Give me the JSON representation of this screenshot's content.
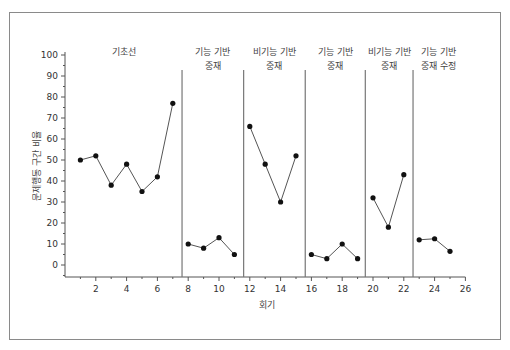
{
  "chart_data": {
    "type": "line",
    "title": "",
    "xlabel": "회기",
    "ylabel": "문제행동 구간 비율",
    "xlim": [
      0,
      26
    ],
    "ylim": [
      -5,
      100
    ],
    "x_ticks": [
      2,
      4,
      6,
      8,
      10,
      12,
      14,
      16,
      18,
      20,
      22,
      24,
      26
    ],
    "y_ticks": [
      0,
      10,
      20,
      30,
      40,
      50,
      60,
      70,
      80,
      90,
      100
    ],
    "grid": false,
    "legend": null,
    "phase_change_lines": [
      7.6,
      11.6,
      15.6,
      19.5,
      22.6
    ],
    "series": [
      {
        "name": "기초선",
        "label_lines": [
          "기초선"
        ],
        "x": [
          1,
          2,
          3,
          4,
          5,
          6,
          7
        ],
        "values": [
          50,
          52,
          38,
          48,
          35,
          42,
          77
        ]
      },
      {
        "name": "기능 기반 중재",
        "label_lines": [
          "기능 기반",
          "중재"
        ],
        "x": [
          8,
          9,
          10,
          11
        ],
        "values": [
          10,
          8,
          13,
          5
        ]
      },
      {
        "name": "비기능 기반 중재",
        "label_lines": [
          "비기능 기반",
          "중재"
        ],
        "x": [
          12,
          13,
          14,
          15
        ],
        "values": [
          66,
          48,
          30,
          52
        ]
      },
      {
        "name": "기능 기반 중재",
        "label_lines": [
          "기능 기반",
          "중재"
        ],
        "x": [
          16,
          17,
          18,
          19
        ],
        "values": [
          5,
          3,
          10,
          3
        ]
      },
      {
        "name": "비기능 기반 중재",
        "label_lines": [
          "비기능 기반",
          "중재"
        ],
        "x": [
          20,
          21,
          22
        ],
        "values": [
          32,
          18,
          43
        ]
      },
      {
        "name": "기능 기반 중재 수정",
        "label_lines": [
          "기능 기반",
          "중재 수정"
        ],
        "x": [
          23,
          24,
          25
        ],
        "values": [
          12,
          12.5,
          6.5
        ]
      }
    ]
  },
  "style": {
    "line_color": "#555555",
    "marker_color": "#111111",
    "axis_color": "#555555",
    "phase_line_color": "#777777",
    "frame_color": "#8a8a8a"
  }
}
